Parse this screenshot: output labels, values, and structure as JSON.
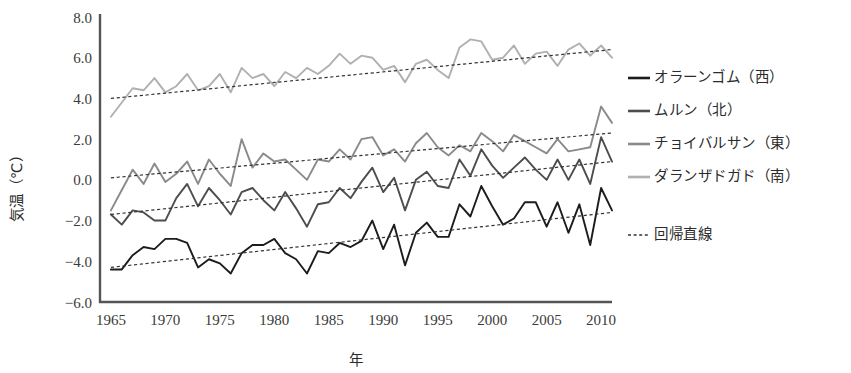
{
  "chart_data": {
    "type": "line",
    "title": "",
    "xlabel": "年",
    "ylabel": "気温（℃）",
    "ylim": [
      -6.0,
      8.0
    ],
    "xlim": [
      1964,
      2011
    ],
    "grid": false,
    "legend_position": "right",
    "y_ticks": [
      "8.0",
      "6.0",
      "4.0",
      "2.0",
      "0.0",
      "−2.0",
      "−4.0",
      "−6.0"
    ],
    "y_tick_values": [
      8.0,
      6.0,
      4.0,
      2.0,
      0.0,
      -2.0,
      -4.0,
      -6.0
    ],
    "x_ticks": [
      "1965",
      "1970",
      "1975",
      "1980",
      "1985",
      "1990",
      "1995",
      "2000",
      "2005",
      "2010"
    ],
    "x_tick_values": [
      1965,
      1970,
      1975,
      1980,
      1985,
      1990,
      1995,
      2000,
      2005,
      2010
    ],
    "x": [
      1965,
      1966,
      1967,
      1968,
      1969,
      1970,
      1971,
      1972,
      1973,
      1974,
      1975,
      1976,
      1977,
      1978,
      1979,
      1980,
      1981,
      1982,
      1983,
      1984,
      1985,
      1986,
      1987,
      1988,
      1989,
      1990,
      1991,
      1992,
      1993,
      1994,
      1995,
      1996,
      1997,
      1998,
      1999,
      2000,
      2001,
      2002,
      2003,
      2004,
      2005,
      2006,
      2007,
      2008,
      2009,
      2010,
      2011
    ],
    "series": [
      {
        "name": "オラーンゴム（西）",
        "region": "西",
        "color": "#1c1c1c",
        "values": [
          -4.4,
          -4.4,
          -3.7,
          -3.3,
          -3.4,
          -2.9,
          -2.9,
          -3.1,
          -4.3,
          -3.9,
          -4.1,
          -4.6,
          -3.6,
          -3.2,
          -3.2,
          -2.9,
          -3.6,
          -3.9,
          -4.6,
          -3.5,
          -3.6,
          -3.1,
          -3.3,
          -3.0,
          -2.0,
          -3.4,
          -2.2,
          -4.2,
          -2.6,
          -2.1,
          -2.8,
          -2.8,
          -1.2,
          -1.8,
          -0.3,
          -1.3,
          -2.2,
          -1.9,
          -1.1,
          -1.1,
          -2.3,
          -1.1,
          -2.6,
          -1.2,
          -3.2,
          -0.4,
          -1.5
        ],
        "trend": {
          "start_value": -4.3,
          "end_value": -1.6
        }
      },
      {
        "name": "ムルン（北）",
        "region": "北",
        "color": "#4d4d4d",
        "values": [
          -1.7,
          -2.2,
          -1.5,
          -1.6,
          -2.0,
          -2.0,
          -0.9,
          -0.2,
          -1.3,
          -0.4,
          -1.0,
          -1.7,
          -0.6,
          -0.4,
          -1.0,
          -1.5,
          -0.6,
          -1.4,
          -2.3,
          -1.2,
          -1.1,
          -0.4,
          -0.9,
          -0.1,
          0.6,
          -0.6,
          0.1,
          -1.5,
          0.0,
          0.4,
          -0.3,
          -0.4,
          1.0,
          0.2,
          1.5,
          0.7,
          0.1,
          0.6,
          1.1,
          0.5,
          0.0,
          1.0,
          0.0,
          1.0,
          -0.2,
          2.1,
          0.9
        ],
        "trend": {
          "start_value": -1.7,
          "end_value": 0.9
        }
      },
      {
        "name": "チョイバルサン（東）",
        "region": "東",
        "color": "#8a8a8a",
        "values": [
          -1.5,
          -0.5,
          0.5,
          -0.2,
          0.8,
          -0.1,
          0.3,
          0.9,
          -0.2,
          1.0,
          0.3,
          -0.3,
          2.0,
          0.6,
          1.3,
          0.9,
          1.0,
          0.5,
          0.0,
          1.0,
          0.9,
          1.5,
          1.0,
          2.0,
          2.1,
          1.2,
          1.5,
          0.9,
          1.8,
          2.3,
          1.6,
          1.2,
          1.7,
          1.4,
          2.3,
          1.9,
          1.4,
          2.2,
          1.9,
          1.6,
          1.3,
          2.0,
          1.4,
          1.5,
          1.6,
          3.6,
          2.8
        ],
        "trend": {
          "start_value": 0.1,
          "end_value": 2.3
        }
      },
      {
        "name": "ダランザドガド（南）",
        "region": "南",
        "color": "#b0b0b0",
        "values": [
          3.1,
          3.8,
          4.5,
          4.4,
          5.0,
          4.3,
          4.6,
          5.2,
          4.4,
          4.6,
          5.2,
          4.3,
          5.5,
          5.0,
          5.2,
          4.6,
          5.3,
          5.0,
          5.5,
          5.2,
          5.6,
          6.2,
          5.7,
          6.1,
          6.0,
          5.4,
          5.6,
          4.8,
          5.7,
          5.9,
          5.4,
          5.0,
          6.5,
          6.9,
          6.8,
          5.9,
          6.0,
          6.6,
          5.7,
          6.2,
          6.3,
          5.6,
          6.4,
          6.7,
          6.1,
          6.6,
          6.0
        ],
        "trend": {
          "start_value": 4.0,
          "end_value": 6.4
        }
      }
    ],
    "trendline_label": "回帰直線",
    "trendline_style": "dotted"
  },
  "legend": {
    "items": [
      {
        "label": "オラーンゴム（西）",
        "color": "#1c1c1c",
        "style": "solid"
      },
      {
        "label": "ムルン（北）",
        "color": "#4d4d4d",
        "style": "solid"
      },
      {
        "label": "チョイバルサン（東）",
        "color": "#8a8a8a",
        "style": "solid"
      },
      {
        "label": "ダランザドガド（南）",
        "color": "#b0b0b0",
        "style": "solid"
      }
    ],
    "trend_item": {
      "label": "回帰直線",
      "color": "#333333",
      "style": "dotted"
    }
  },
  "axes": {
    "y_title": "気温（℃）",
    "x_title": "年",
    "axis_color": "#555555"
  }
}
